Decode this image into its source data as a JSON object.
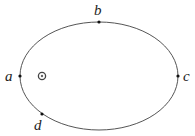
{
  "diagram": {
    "type": "orbit-ellipse",
    "ellipse": {
      "cx": 99,
      "cy": 76,
      "rx": 79,
      "ry": 54,
      "stroke": "#555555"
    },
    "focus": {
      "x": 42,
      "y": 76,
      "symbol": "sun-icon"
    },
    "points": [
      {
        "id": "a",
        "label": "a",
        "x": 20,
        "y": 76,
        "label_x": 5,
        "label_y": 81
      },
      {
        "id": "b",
        "label": "b",
        "x": 99,
        "y": 22,
        "label_x": 94,
        "label_y": 15
      },
      {
        "id": "c",
        "label": "c",
        "x": 178,
        "y": 76,
        "label_x": 183,
        "label_y": 81
      },
      {
        "id": "d",
        "label": "d",
        "x": 42,
        "y": 114,
        "label_x": 34,
        "label_y": 130
      }
    ]
  }
}
